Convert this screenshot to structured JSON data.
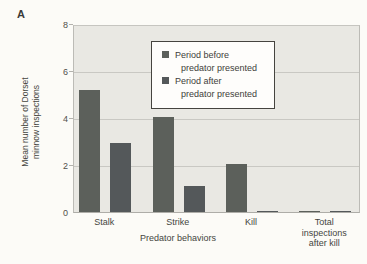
{
  "panel_label": "A",
  "legend": {
    "items": [
      {
        "line1": "Period before",
        "line2": "predator presented"
      },
      {
        "line1": "Period after",
        "line2": "predator presented"
      }
    ]
  },
  "chart_data": {
    "type": "bar",
    "title": "",
    "categories": [
      "Stalk",
      "Strike",
      "Kill",
      "Total inspections after kill"
    ],
    "series": [
      {
        "name": "Period before predator presented",
        "color": "#5c605b",
        "values": [
          5.2,
          4.05,
          2.05,
          0.06
        ]
      },
      {
        "name": "Period after predator presented",
        "color": "#54585a",
        "values": [
          2.95,
          1.1,
          0.05,
          0.04
        ]
      }
    ],
    "xlabel": "Predator behaviors",
    "ylabel": "Mean number of Dorset minnow inspections",
    "ylabel_lines": [
      "Mean number of Dorset",
      "minnow inspections"
    ],
    "yticks": [
      0,
      2,
      4,
      6,
      8
    ],
    "ylim": [
      0,
      8
    ],
    "grid": true,
    "legend_position": "upper center",
    "plot_bg": "#e9e8e3",
    "gridline_color": "#c9c8c3"
  }
}
